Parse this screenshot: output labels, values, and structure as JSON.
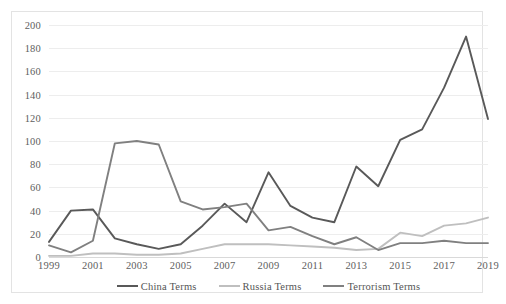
{
  "chart_data": {
    "type": "line",
    "title": "",
    "xlabel": "",
    "ylabel": "",
    "x": [
      1999,
      2000,
      2001,
      2002,
      2003,
      2004,
      2005,
      2006,
      2007,
      2008,
      2009,
      2010,
      2011,
      2012,
      2013,
      2014,
      2015,
      2016,
      2017,
      2018,
      2019
    ],
    "xlim": [
      1999,
      2019
    ],
    "ylim": [
      0,
      200
    ],
    "yticks": [
      0,
      20,
      40,
      60,
      80,
      100,
      120,
      140,
      160,
      180,
      200
    ],
    "xticks": [
      1999,
      2001,
      2003,
      2005,
      2007,
      2009,
      2011,
      2013,
      2015,
      2017,
      2019
    ],
    "xtick_labels": [
      "1999",
      "2001",
      "2003",
      "2005",
      "2007",
      "2009",
      "2011",
      "2013",
      "2015",
      "2017",
      "2019"
    ],
    "ytick_labels": [
      "0",
      "20",
      "40",
      "60",
      "80",
      "100",
      "120",
      "140",
      "160",
      "180",
      "200"
    ],
    "grid": true,
    "grid_axis": "y",
    "legend_position": "bottom",
    "series": [
      {
        "name": "China Terms",
        "color": "#595959",
        "values": [
          13,
          40,
          41,
          16,
          11,
          7,
          11,
          27,
          46,
          30,
          73,
          44,
          34,
          30,
          78,
          61,
          101,
          110,
          146,
          190,
          119
        ]
      },
      {
        "name": "Russia Terms",
        "color": "#bfbfbf",
        "values": [
          1,
          1,
          3,
          3,
          2,
          2,
          3,
          7,
          11,
          11,
          11,
          10,
          9,
          8,
          6,
          7,
          21,
          18,
          27,
          29,
          34
        ]
      },
      {
        "name": "Terrorism Terms",
        "color": "#808080",
        "values": [
          10,
          4,
          14,
          98,
          100,
          97,
          48,
          41,
          43,
          46,
          23,
          26,
          18,
          11,
          17,
          6,
          12,
          12,
          14,
          12,
          12
        ]
      }
    ]
  },
  "legend": {
    "items": [
      {
        "label": "China Terms"
      },
      {
        "label": "Russia Terms"
      },
      {
        "label": "Terrorism Terms"
      }
    ]
  }
}
